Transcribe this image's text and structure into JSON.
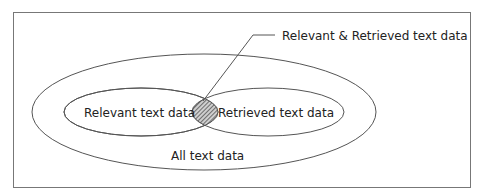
{
  "diagram": {
    "type": "venn",
    "sets": [
      {
        "id": "all",
        "label": "All text data"
      },
      {
        "id": "relevant",
        "label": "Relevant text data"
      },
      {
        "id": "retrieved",
        "label": "Retrieved text data"
      }
    ],
    "intersection": {
      "label": "Relevant & Retrieved text data",
      "sets": [
        "relevant",
        "retrieved"
      ],
      "fill": "hatched"
    },
    "colors": {
      "stroke": "#555555",
      "frame": "#777777",
      "text": "#222222",
      "hatch": "#444444"
    }
  },
  "labels": {
    "all": "All text data",
    "relevant": "Relevant text data",
    "retrieved": "Retrieved text data",
    "intersection": "Relevant & Retrieved text data"
  }
}
